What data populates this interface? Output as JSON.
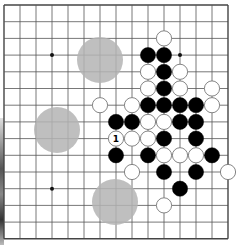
{
  "board": {
    "size": 15,
    "origin": {
      "x": 4,
      "y": 5
    },
    "spacing": {
      "x": 16,
      "y": 16.7
    },
    "line_color": "#555555",
    "border_color": "#444444",
    "stone_radius": 7.6,
    "colors": {
      "black": "#000000",
      "white": "#ffffff",
      "white_stroke": "#777777",
      "hint": "#b4b4b4"
    },
    "star_points": [
      [
        3,
        3
      ],
      [
        11,
        3
      ],
      [
        3,
        11
      ]
    ],
    "hint_circles": [
      {
        "cx": 100,
        "cy": 60,
        "r": 23
      },
      {
        "cx": 57,
        "cy": 130,
        "r": 23
      },
      {
        "cx": 115,
        "cy": 202,
        "r": 23
      }
    ],
    "stones": [
      {
        "c": 10,
        "r": 2,
        "color": "white"
      },
      {
        "c": 9,
        "r": 3,
        "color": "black"
      },
      {
        "c": 10,
        "r": 3,
        "color": "black"
      },
      {
        "c": 9,
        "r": 4,
        "color": "white"
      },
      {
        "c": 10,
        "r": 4,
        "color": "black"
      },
      {
        "c": 11,
        "r": 4,
        "color": "white"
      },
      {
        "c": 9,
        "r": 5,
        "color": "white"
      },
      {
        "c": 10,
        "r": 5,
        "color": "black"
      },
      {
        "c": 11,
        "r": 5,
        "color": "white"
      },
      {
        "c": 13,
        "r": 5,
        "color": "white"
      },
      {
        "c": 6,
        "r": 6,
        "color": "white"
      },
      {
        "c": 8,
        "r": 6,
        "color": "white"
      },
      {
        "c": 9,
        "r": 6,
        "color": "black"
      },
      {
        "c": 10,
        "r": 6,
        "color": "black"
      },
      {
        "c": 11,
        "r": 6,
        "color": "black"
      },
      {
        "c": 12,
        "r": 6,
        "color": "black"
      },
      {
        "c": 13,
        "r": 6,
        "color": "white"
      },
      {
        "c": 7,
        "r": 7,
        "color": "black"
      },
      {
        "c": 8,
        "r": 7,
        "color": "black"
      },
      {
        "c": 9,
        "r": 7,
        "color": "white"
      },
      {
        "c": 10,
        "r": 7,
        "color": "white"
      },
      {
        "c": 11,
        "r": 7,
        "color": "black"
      },
      {
        "c": 12,
        "r": 7,
        "color": "black"
      },
      {
        "c": 7,
        "r": 8,
        "color": "white",
        "label": "1"
      },
      {
        "c": 8,
        "r": 8,
        "color": "white"
      },
      {
        "c": 9,
        "r": 8,
        "color": "white"
      },
      {
        "c": 10,
        "r": 8,
        "color": "black"
      },
      {
        "c": 12,
        "r": 8,
        "color": "black"
      },
      {
        "c": 7,
        "r": 9,
        "color": "black"
      },
      {
        "c": 9,
        "r": 9,
        "color": "black"
      },
      {
        "c": 10,
        "r": 9,
        "color": "white"
      },
      {
        "c": 11,
        "r": 9,
        "color": "white"
      },
      {
        "c": 12,
        "r": 9,
        "color": "white"
      },
      {
        "c": 13,
        "r": 9,
        "color": "black"
      },
      {
        "c": 8,
        "r": 10,
        "color": "white"
      },
      {
        "c": 10,
        "r": 10,
        "color": "black"
      },
      {
        "c": 12,
        "r": 10,
        "color": "black"
      },
      {
        "c": 14,
        "r": 10,
        "color": "white"
      },
      {
        "c": 11,
        "r": 11,
        "color": "black"
      },
      {
        "c": 10,
        "r": 12,
        "color": "white"
      }
    ]
  }
}
